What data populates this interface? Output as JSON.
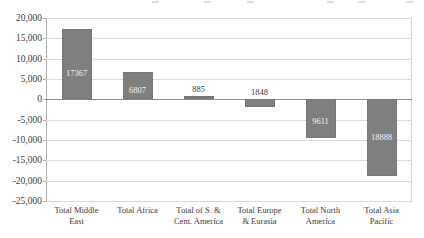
{
  "chart_data": {
    "type": "bar",
    "title": "",
    "subtitle": "",
    "xlabel": "",
    "ylabel": "",
    "categories": [
      "Total Middle East",
      "Total Africa",
      "Total of S. & Cent. America",
      "Total Europe & Eurasia",
      "Total North America",
      "Total Asia Pacific"
    ],
    "category_lines": [
      [
        "Total Middle",
        "East"
      ],
      [
        "Total Africa"
      ],
      [
        "Total of S. &",
        "Cent. America"
      ],
      [
        "Total Europe",
        "& Eurasia"
      ],
      [
        "Total North",
        "America"
      ],
      [
        "Total Asia",
        "Pacific"
      ]
    ],
    "values": [
      17367,
      6807,
      885,
      -1848,
      -9611,
      -18888
    ],
    "data_labels": [
      "17367",
      "6807",
      "885",
      "1848",
      "9611",
      "18888"
    ],
    "ylim": [
      -25000,
      20000
    ],
    "ytick_values": [
      20000,
      15000,
      10000,
      5000,
      0,
      -5000,
      -10000,
      -15000,
      -20000,
      -25000
    ],
    "ytick_labels": [
      "20,000",
      "15,000",
      "10,000",
      "5,000",
      "0",
      "-5,000",
      "-10,000",
      "-15,000",
      "-20,000",
      "-25,000"
    ],
    "grid": true,
    "legend": false,
    "legend_position": "none",
    "bar_color": "#7f7f7f",
    "gridline_color": "#d9d9d9",
    "zero_line_color": "#8a8a8a",
    "label_color_inside": "#f2f2f2",
    "label_color_outside": "#3a3a3a"
  }
}
